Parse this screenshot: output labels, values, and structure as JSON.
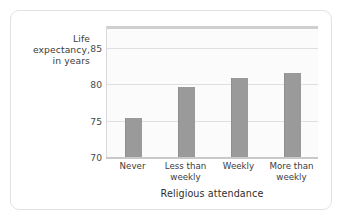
{
  "chart_data": {
    "type": "bar",
    "title": "",
    "subtitle": "",
    "xlabel": "Religious attendance",
    "ylabel": "Life expectancy, in years",
    "ylabel_lines": [
      "Life",
      "expectancy,",
      "in years"
    ],
    "categories": [
      "Never",
      "Less than weekly",
      "Weekly",
      "More than weekly"
    ],
    "category_lines": [
      [
        "Never"
      ],
      [
        "Less than",
        "weekly"
      ],
      [
        "Weekly"
      ],
      [
        "More than",
        "weekly"
      ]
    ],
    "values": [
      75.3,
      79.6,
      80.9,
      81.5
    ],
    "ylim": [
      70,
      88
    ],
    "yticks": [
      70,
      75,
      80,
      85
    ],
    "ytick_labels": [
      "70",
      "75",
      "80",
      "85"
    ],
    "grid": true,
    "grid_axis": "y",
    "legend": null,
    "bar_color": "#9a9a9a",
    "plot_bg": "#fbfbfb",
    "gridline_color": "#dfdfe1",
    "axis_color": "#c9c9cb",
    "text_color": "#3b3b3b",
    "card_border_color": "#e2e2e4",
    "page_bg": "#ffffff"
  }
}
